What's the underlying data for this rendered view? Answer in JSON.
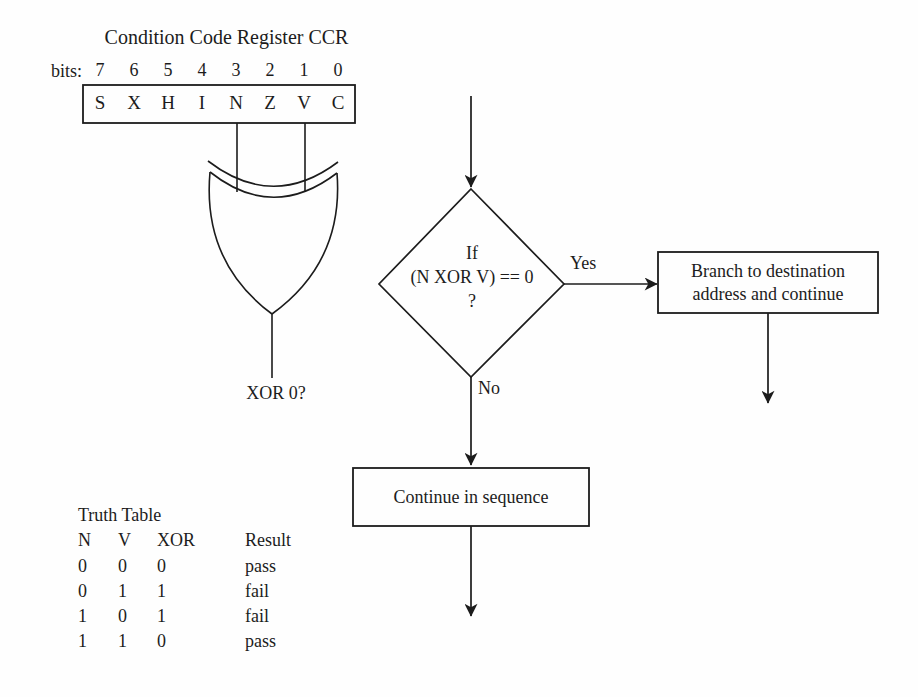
{
  "register": {
    "title": "Condition Code Register CCR",
    "bits_label": "bits:",
    "bit_numbers": [
      "7",
      "6",
      "5",
      "4",
      "3",
      "2",
      "1",
      "0"
    ],
    "flags": [
      "S",
      "X",
      "H",
      "I",
      "N",
      "Z",
      "V",
      "C"
    ]
  },
  "xor_gate": {
    "output_label": "XOR 0?"
  },
  "flowchart": {
    "decision": {
      "line1": "If",
      "line2": "(N XOR V) == 0",
      "line3": "?"
    },
    "yes_label": "Yes",
    "no_label": "No",
    "branch_box": {
      "line1": "Branch to destination",
      "line2": "address and continue"
    },
    "continue_box": {
      "label": "Continue in sequence"
    }
  },
  "truth_table": {
    "title": "Truth Table",
    "headers": [
      "N",
      "V",
      "XOR",
      "Result"
    ],
    "rows": [
      [
        "0",
        "0",
        "0",
        "pass"
      ],
      [
        "0",
        "1",
        "1",
        "fail"
      ],
      [
        "1",
        "0",
        "1",
        "fail"
      ],
      [
        "1",
        "1",
        "0",
        "pass"
      ]
    ]
  },
  "colors": {
    "ink": "#1c1c1c",
    "background": "#fefefe"
  }
}
